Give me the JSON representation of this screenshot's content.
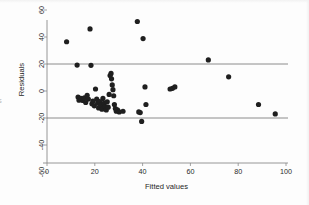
{
  "chart_data": {
    "type": "scatter",
    "title": "",
    "xlabel": "Fitted values",
    "ylabel": "Residuals",
    "xlim": [
      0,
      100
    ],
    "ylim": [
      -60,
      60
    ],
    "xticks": [
      0,
      20,
      40,
      60,
      80,
      100
    ],
    "yticks": [
      60,
      40,
      20,
      0,
      -20,
      -40,
      -60
    ],
    "xtick_labels": [
      "0",
      "20",
      "40",
      "60",
      "80",
      "100"
    ],
    "ytick_labels": [
      "60",
      "40",
      "20",
      "0",
      "-20",
      "-40",
      "-60"
    ],
    "grid": false,
    "legend": null,
    "point_color": "#1f1f1f",
    "point_size": 2.6,
    "reference_lines": [
      {
        "type": "horizontal",
        "y": 20,
        "color": "#6e6e6e"
      },
      {
        "type": "horizontal",
        "y": -20,
        "color": "#6e6e6e"
      }
    ],
    "points": [
      {
        "x": 8.2,
        "y": 36.5
      },
      {
        "x": 12.6,
        "y": 19.2
      },
      {
        "x": 13.0,
        "y": -4.5
      },
      {
        "x": 13.4,
        "y": -6.8
      },
      {
        "x": 14.2,
        "y": -5.5
      },
      {
        "x": 15.0,
        "y": -7.0
      },
      {
        "x": 15.6,
        "y": -5.0
      },
      {
        "x": 16.2,
        "y": -8.5
      },
      {
        "x": 16.8,
        "y": -3.2
      },
      {
        "x": 17.3,
        "y": -6.0
      },
      {
        "x": 18.0,
        "y": 46.0
      },
      {
        "x": 18.4,
        "y": 19.0
      },
      {
        "x": 18.8,
        "y": -9.5
      },
      {
        "x": 19.2,
        "y": -7.5
      },
      {
        "x": 19.8,
        "y": -11.0
      },
      {
        "x": 20.3,
        "y": 1.5
      },
      {
        "x": 20.8,
        "y": -6.0
      },
      {
        "x": 21.2,
        "y": -9.0
      },
      {
        "x": 21.6,
        "y": -12.5
      },
      {
        "x": 22.0,
        "y": -7.8
      },
      {
        "x": 22.5,
        "y": -10.5
      },
      {
        "x": 23.0,
        "y": -13.5
      },
      {
        "x": 23.4,
        "y": -5.5
      },
      {
        "x": 23.9,
        "y": -9.0
      },
      {
        "x": 24.3,
        "y": -11.5
      },
      {
        "x": 24.8,
        "y": -14.0
      },
      {
        "x": 25.2,
        "y": -8.0
      },
      {
        "x": 25.6,
        "y": -12.0
      },
      {
        "x": 26.0,
        "y": -2.5
      },
      {
        "x": 26.4,
        "y": 11.5
      },
      {
        "x": 26.8,
        "y": 13.0
      },
      {
        "x": 27.0,
        "y": 9.0
      },
      {
        "x": 27.3,
        "y": 4.5
      },
      {
        "x": 27.6,
        "y": 1.0
      },
      {
        "x": 27.9,
        "y": -3.5
      },
      {
        "x": 28.2,
        "y": -10.0
      },
      {
        "x": 28.6,
        "y": -13.0
      },
      {
        "x": 29.0,
        "y": -15.0
      },
      {
        "x": 29.5,
        "y": -14.0
      },
      {
        "x": 30.2,
        "y": -15.5
      },
      {
        "x": 31.8,
        "y": -15.0
      },
      {
        "x": 37.8,
        "y": 51.5
      },
      {
        "x": 38.4,
        "y": -15.5
      },
      {
        "x": 39.0,
        "y": -16.0
      },
      {
        "x": 39.6,
        "y": -22.5
      },
      {
        "x": 40.2,
        "y": 38.8
      },
      {
        "x": 41.0,
        "y": 3.0
      },
      {
        "x": 41.4,
        "y": -10.0
      },
      {
        "x": 51.5,
        "y": 1.5
      },
      {
        "x": 52.5,
        "y": 2.0
      },
      {
        "x": 53.5,
        "y": 3.0
      },
      {
        "x": 67.5,
        "y": 23.0
      },
      {
        "x": 76.0,
        "y": 10.5
      },
      {
        "x": 88.5,
        "y": -10.0
      },
      {
        "x": 95.5,
        "y": -17.0
      }
    ]
  },
  "edge": {
    "left_fragment": "s"
  }
}
